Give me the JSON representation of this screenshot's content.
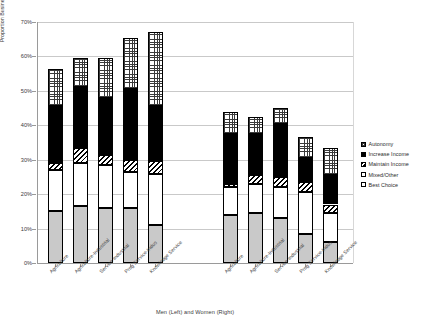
{
  "chart_data": {
    "type": "bar",
    "subtype": "stacked",
    "title": "",
    "xlabel": "Men (Left) and Women (Right)",
    "ylabel": "Proportion Business Creators",
    "ylim": [
      0,
      70
    ],
    "ytick_labels": [
      "0%",
      "10%",
      "20%",
      "30%",
      "40%",
      "50%",
      "60%",
      "70%"
    ],
    "ytick_values": [
      0,
      10,
      20,
      30,
      40,
      50,
      60,
      70
    ],
    "grid": true,
    "grid_axis": "y",
    "legend_position": "right",
    "legend": [
      "Autonomy",
      "Increase Income",
      "Maintain Income",
      "Mixed/Other",
      "Best Choice"
    ],
    "groups": [
      {
        "name": "Men (Left)"
      },
      {
        "name": "Women (Right)"
      }
    ],
    "categories": [
      "Agriculture",
      "Agriculture-Industrial",
      "Service-Industrial",
      "Prog Service-Indus",
      "Knowledge Service"
    ],
    "series": [
      {
        "name": "Best Choice",
        "key": "best",
        "men": [
          15.0,
          16.5,
          16.0,
          16.0,
          11.0
        ],
        "women": [
          14.0,
          14.5,
          13.0,
          8.5,
          6.0
        ]
      },
      {
        "name": "Mixed/Other",
        "key": "mixed",
        "men": [
          12.0,
          12.5,
          12.5,
          10.5,
          15.0
        ],
        "women": [
          8.0,
          8.5,
          9.0,
          12.0,
          8.5
        ]
      },
      {
        "name": "Maintain Income",
        "key": "maintain",
        "men": [
          2.0,
          4.5,
          3.0,
          3.5,
          3.5
        ],
        "women": [
          1.0,
          2.5,
          3.0,
          3.0,
          2.5
        ]
      },
      {
        "name": "Increase Income",
        "key": "increase",
        "men": [
          16.5,
          17.5,
          16.5,
          20.5,
          16.0
        ],
        "women": [
          14.5,
          12.0,
          15.5,
          7.0,
          8.5
        ]
      },
      {
        "name": "Autonomy",
        "key": "autonomy",
        "men": [
          11.0,
          8.5,
          11.5,
          15.0,
          21.5
        ],
        "women": [
          6.5,
          5.0,
          4.5,
          6.0,
          8.0
        ]
      }
    ],
    "totals": {
      "men": [
        56.5,
        59.5,
        59.5,
        65.5,
        67.0
      ],
      "women": [
        44.0,
        42.5,
        45.0,
        36.5,
        33.5
      ]
    }
  },
  "legend": {
    "items": [
      {
        "label": "Autonomy",
        "key": "autonomy"
      },
      {
        "label": "Increase Income",
        "key": "increase"
      },
      {
        "label": "Maintain Income",
        "key": "maintain"
      },
      {
        "label": "Mixed/Other",
        "key": "mixed"
      },
      {
        "label": "Best Choice",
        "key": "best"
      }
    ]
  },
  "colors": {
    "best_choice": "#c9c9c9",
    "mixed_other": "#ffffff",
    "maintain_income": "#ffffff",
    "increase_income": "#000000",
    "autonomy": "#ffffff",
    "gridline": "#c9c9c9",
    "axis": "#9a9a9a",
    "text": "#3b3b3b"
  }
}
